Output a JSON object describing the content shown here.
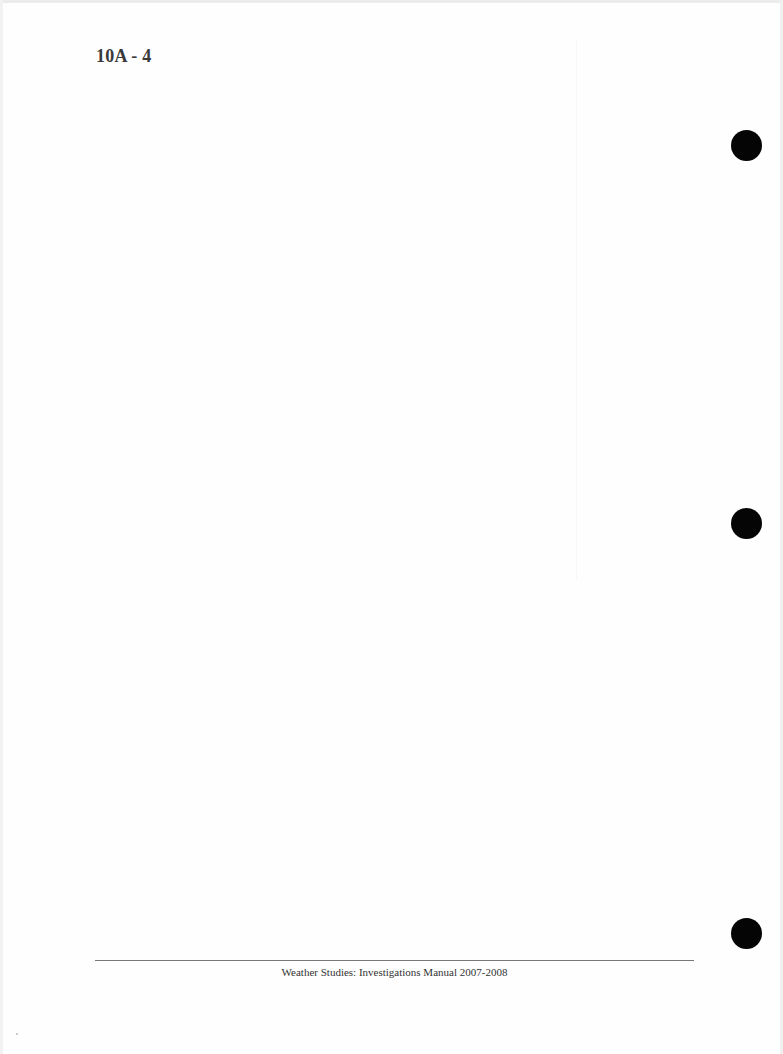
{
  "page": {
    "page_number": "10A - 4",
    "footer": "Weather Studies: Investigations Manual 2007-2008",
    "body_content": "",
    "binder_holes": [
      {
        "position": "top",
        "color": "#050505"
      },
      {
        "position": "middle",
        "color": "#050505"
      },
      {
        "position": "bottom",
        "color": "#050505"
      }
    ]
  }
}
